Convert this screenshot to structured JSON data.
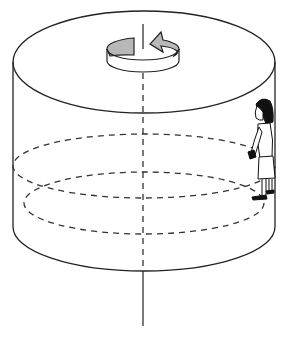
{
  "diagram": {
    "title": "Rotating cylinder with person pressed against inner wall",
    "elements": {
      "cylinder": {
        "label": "cylinder",
        "stroke": "#222222"
      },
      "rotation_axis": {
        "label": "rotation axis"
      },
      "rotation_arrow": {
        "label": "rotation direction arrow",
        "fill": "#b8b8b8"
      },
      "upper_dashed_ring": {
        "label": "hidden circular path"
      },
      "floor_dashed_ring": {
        "label": "floor outline"
      },
      "person": {
        "label": "person standing against wall"
      }
    }
  }
}
